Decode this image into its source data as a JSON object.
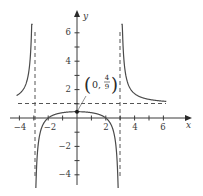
{
  "chart_data": {
    "type": "line",
    "title": "",
    "function": "f(x) = (x^2 - 4) / (x^2 - 9)",
    "xlabel": "x",
    "ylabel": "y",
    "xlim": [
      -4.8,
      7.3
    ],
    "ylim": [
      -4.6,
      7.2
    ],
    "x_ticks": [
      -4,
      -3,
      -2,
      -1,
      1,
      2,
      3,
      4,
      5,
      6
    ],
    "x_tick_labels": [
      {
        "value": -4,
        "label": "−4"
      },
      {
        "value": -2,
        "label": "−2"
      },
      {
        "value": 2,
        "label": "2"
      },
      {
        "value": 4,
        "label": "4"
      },
      {
        "value": 6,
        "label": "6"
      }
    ],
    "y_ticks": [
      -4,
      -3,
      -2,
      -1,
      1,
      2,
      3,
      4,
      5,
      6
    ],
    "y_tick_labels": [
      {
        "value": 6,
        "label": "6"
      },
      {
        "value": 4,
        "label": "4"
      },
      {
        "value": 2,
        "label": "2"
      },
      {
        "value": -2,
        "label": "−2"
      },
      {
        "value": -4,
        "label": "−4"
      }
    ],
    "grid": false,
    "legend": null,
    "asymptotes": {
      "vertical": [
        -3,
        3
      ],
      "horizontal": [
        1
      ],
      "style": "dashed"
    },
    "series": [
      {
        "name": "left branch",
        "x_range": [
          -4.2,
          -3.06
        ],
        "points": [
          [
            -4.2,
            1.58
          ],
          [
            -4.0,
            1.71
          ],
          [
            -3.8,
            1.91
          ],
          [
            -3.6,
            2.26
          ],
          [
            -3.4,
            2.95
          ],
          [
            -3.25,
            4.2
          ],
          [
            -3.15,
            5.9
          ]
        ]
      },
      {
        "name": "middle branch",
        "x_range": [
          -2.95,
          2.95
        ],
        "points": [
          [
            -2.95,
            -4.3
          ],
          [
            -2.8,
            -1.6
          ],
          [
            -2.5,
            -0.82
          ],
          [
            -2.0,
            0.0
          ],
          [
            -1.5,
            0.26
          ],
          [
            -1.0,
            0.375
          ],
          [
            0.0,
            0.444
          ],
          [
            1.0,
            0.375
          ],
          [
            1.5,
            0.26
          ],
          [
            2.0,
            0.0
          ],
          [
            2.5,
            -0.82
          ],
          [
            2.8,
            -1.6
          ],
          [
            2.95,
            -4.3
          ]
        ]
      },
      {
        "name": "right branch",
        "x_range": [
          3.06,
          6.2
        ],
        "points": [
          [
            3.15,
            5.9
          ],
          [
            3.25,
            4.2
          ],
          [
            3.5,
            2.6
          ],
          [
            4.0,
            1.71
          ],
          [
            5.0,
            1.33
          ],
          [
            6.0,
            1.19
          ],
          [
            6.2,
            1.17
          ]
        ]
      }
    ],
    "annotations": [
      {
        "point": [
          0,
          0.444
        ],
        "label": "(0, 4/9)",
        "numerator": "4",
        "denominator": "9",
        "prefix": "0,",
        "marker": "filled-dot"
      }
    ]
  },
  "labels": {
    "x_axis": "x",
    "y_axis": "y",
    "point_prefix": "0,",
    "point_num": "4",
    "point_den": "9",
    "xt_m4": "−4",
    "xt_m2": "−2",
    "xt_2": "2",
    "xt_4": "4",
    "xt_6": "6",
    "yt_6": "6",
    "yt_4": "4",
    "yt_2": "2",
    "yt_m2": "−2",
    "yt_m4": "−4"
  },
  "colors": {
    "curve": "#4a4a4a",
    "axes": "#3a3a3a",
    "asymptote": "#555555",
    "background": "#ffffff"
  }
}
